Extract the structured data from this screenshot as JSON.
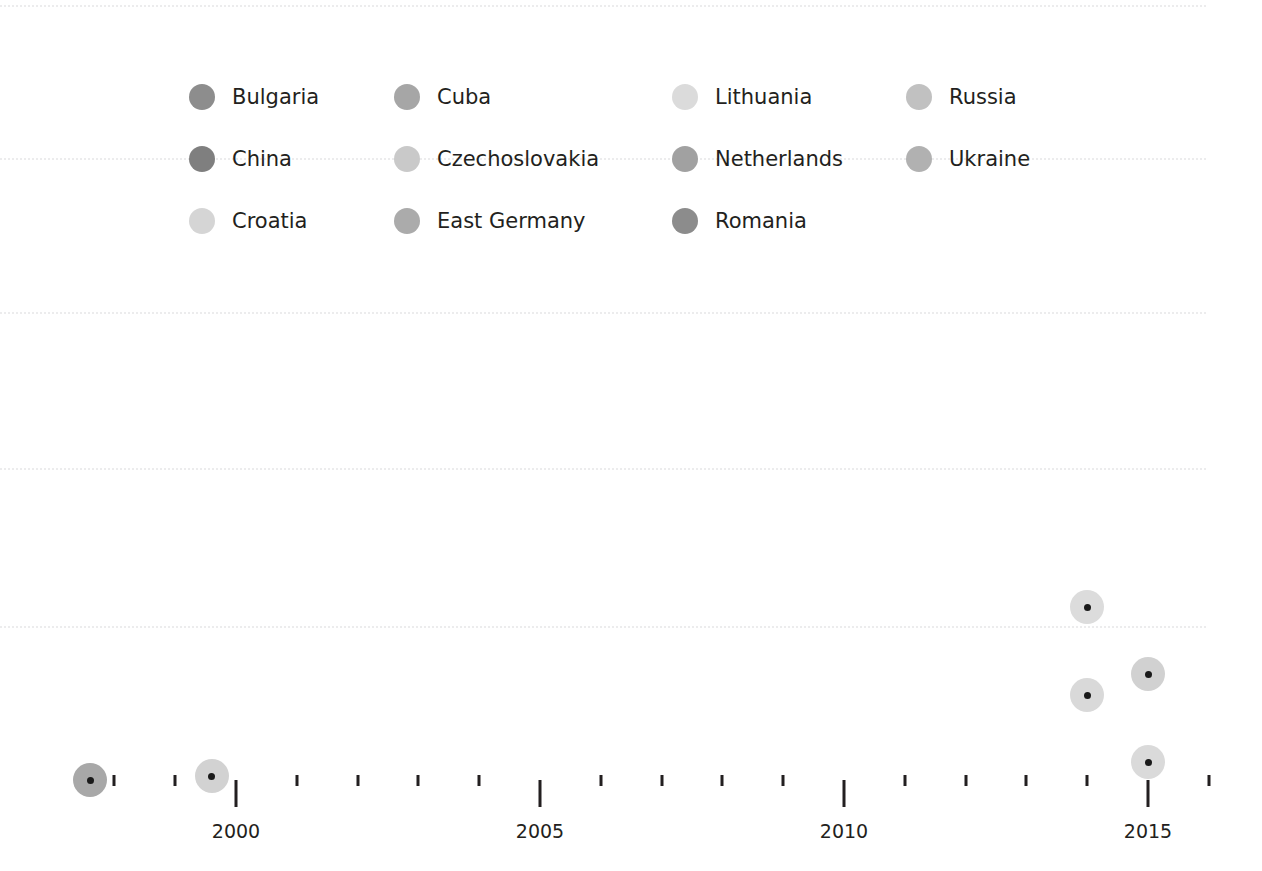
{
  "page": {
    "number": "55",
    "background_color": "#ffffff"
  },
  "legend": {
    "columns_x": [
      189,
      394,
      672,
      906
    ],
    "rows_y": [
      97,
      159,
      221
    ],
    "items": [
      {
        "label": "Bulgaria",
        "color": "#8d8d8d",
        "col": 0,
        "row": 0
      },
      {
        "label": "China",
        "color": "#7f7f7f",
        "col": 0,
        "row": 1
      },
      {
        "label": "Croatia",
        "color": "#d5d5d5",
        "col": 0,
        "row": 2
      },
      {
        "label": "Cuba",
        "color": "#a6a6a6",
        "col": 1,
        "row": 0
      },
      {
        "label": "Czechoslovakia",
        "color": "#c9c9c9",
        "col": 1,
        "row": 1
      },
      {
        "label": "East Germany",
        "color": "#ababab",
        "col": 1,
        "row": 2
      },
      {
        "label": "Lithuania",
        "color": "#dbdbdb",
        "col": 2,
        "row": 0
      },
      {
        "label": "Netherlands",
        "color": "#a1a1a1",
        "col": 2,
        "row": 1
      },
      {
        "label": "Romania",
        "color": "#8c8c8c",
        "col": 2,
        "row": 2
      },
      {
        "label": "Russia",
        "color": "#c1c1c1",
        "col": 3,
        "row": 0
      },
      {
        "label": "Ukraine",
        "color": "#b1b1b1",
        "col": 3,
        "row": 1
      }
    ]
  },
  "chart_data": {
    "type": "scatter",
    "title": "",
    "xlabel": "",
    "ylabel": "",
    "grid": true,
    "legend_position": "top",
    "xlim": [
      1997.3,
      2016.3
    ],
    "x_major_ticks": [
      2000,
      2005,
      2010,
      2015
    ],
    "x_major_tick_labels": [
      "2000",
      "2005",
      "2010",
      "2015"
    ],
    "x_minor_ticks": [
      1998,
      1999,
      2001,
      2002,
      2003,
      2004,
      2006,
      2007,
      2008,
      2009,
      2011,
      2012,
      2013,
      2014,
      2016
    ],
    "gridline_y_px": [
      5,
      158,
      312,
      468,
      626
    ],
    "points": [
      {
        "x": 1997.6,
        "y_px": 780,
        "color": "#a8a8a8",
        "radius": 17
      },
      {
        "x": 1999.6,
        "y_px": 776,
        "color": "#d2d2d2",
        "radius": 17
      },
      {
        "x": 2014.0,
        "y_px": 607,
        "color": "#dcdcdc",
        "radius": 17
      },
      {
        "x": 2014.0,
        "y_px": 695,
        "color": "#d9d9d9",
        "radius": 17
      },
      {
        "x": 2015.0,
        "y_px": 674,
        "color": "#d1d1d1",
        "radius": 17
      },
      {
        "x": 2015.0,
        "y_px": 762,
        "color": "#dadada",
        "radius": 17
      }
    ]
  },
  "axis_geometry": {
    "x_origin_px": 236,
    "px_per_year": 60.8,
    "tick_top_minor_px": 775,
    "tick_top_major_px": 780,
    "label_y_px": 820,
    "gridline_right_px": 1206
  }
}
